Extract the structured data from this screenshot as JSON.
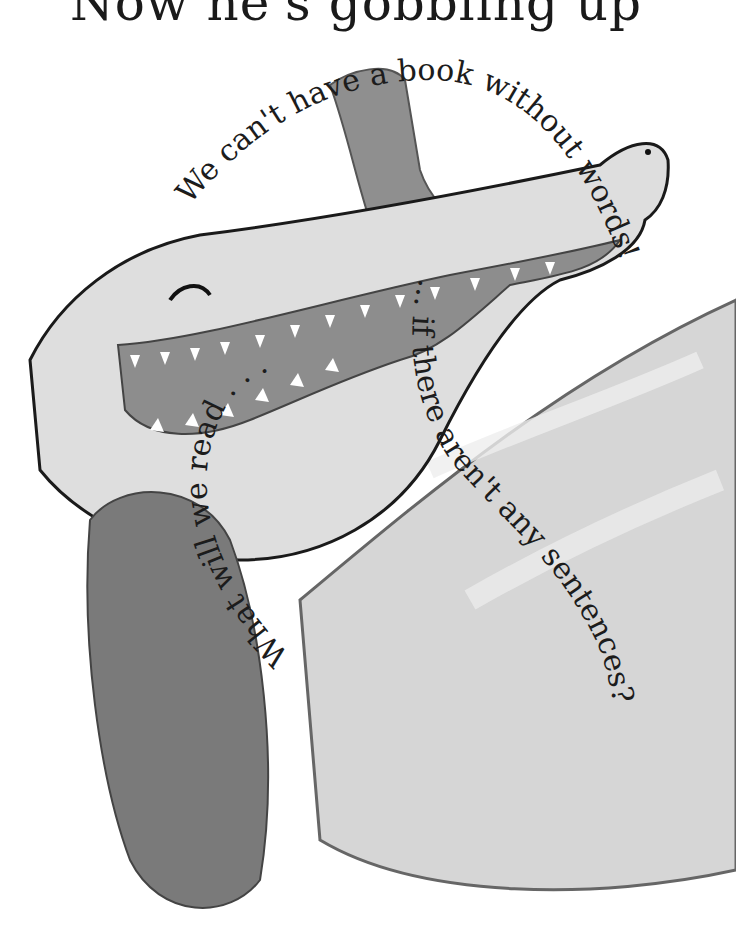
{
  "page": {
    "title_partial": "Now he's gobbling up"
  },
  "illustration": {
    "subject": "crocodile with open mouth, drawn in grayscale watercolor",
    "colors": {
      "body": "#dcdcdc",
      "belly": "#e9e9e9",
      "mouth": "#8a8a8a",
      "tail": "#7c7c7c",
      "outline": "#111111",
      "text": "#1c1c1c"
    }
  },
  "curved_text": {
    "line1": "We can't have a book without words!",
    "line2": "... if there aren't any sentences?",
    "line3": "What will we read . . ."
  }
}
